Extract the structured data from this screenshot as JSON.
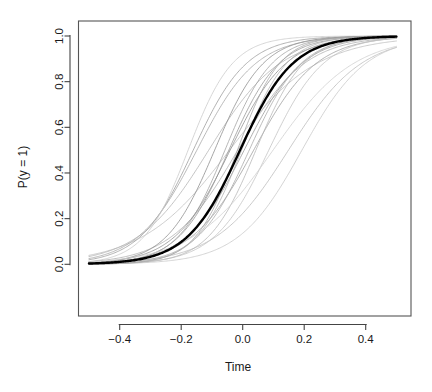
{
  "figure": {
    "type": "r-base-graphics-plot",
    "background_color": "#ffffff",
    "width": 432,
    "height": 392
  },
  "chart_data": {
    "type": "line",
    "title": "",
    "subtitle": "",
    "xlabel": "Time",
    "ylabel": "P(y = 1)",
    "xlim": [
      -0.5,
      0.5
    ],
    "ylim": [
      0.0,
      1.0
    ],
    "grid": false,
    "legend": null,
    "legend_position": "none",
    "x_ticks": [
      -0.4,
      -0.2,
      0.0,
      0.2,
      0.4
    ],
    "x_tick_labels": [
      "-0.4",
      "-0.2",
      "0.0",
      "0.2",
      "0.4"
    ],
    "y_ticks": [
      0.0,
      0.2,
      0.4,
      0.6,
      0.8,
      1.0
    ],
    "y_tick_labels": [
      "0.0",
      "0.2",
      "0.4",
      "0.6",
      "0.8",
      "1.0"
    ],
    "box_drawn": true,
    "box_color": "#555555",
    "series": [
      {
        "name": "draw-1",
        "role": "draw",
        "color": "#bfbfbf",
        "linewidth": 0.8,
        "model": "logistic",
        "intercept": 0.3,
        "slope": 7.0,
        "values_at_ticks": [
          0.02,
          0.08,
          0.57,
          0.95,
          0.99
        ]
      },
      {
        "name": "draw-2",
        "role": "draw",
        "color": "#b5b5b5",
        "linewidth": 0.8,
        "model": "logistic",
        "intercept": 0.95,
        "slope": 8.6,
        "values_at_ticks": [
          0.05,
          0.22,
          0.72,
          0.96,
          0.995
        ]
      },
      {
        "name": "draw-3",
        "role": "draw",
        "color": "#9e9e9e",
        "linewidth": 0.8,
        "model": "logistic",
        "intercept": 1.85,
        "slope": 11.5,
        "values_at_ticks": [
          0.03,
          0.24,
          0.86,
          0.99,
          1.0
        ]
      },
      {
        "name": "draw-4",
        "role": "draw",
        "color": "#a8a8a8",
        "linewidth": 0.8,
        "model": "logistic",
        "intercept": 1.55,
        "slope": 10.4,
        "values_at_ticks": [
          0.03,
          0.19,
          0.82,
          0.98,
          1.0
        ]
      },
      {
        "name": "draw-5",
        "role": "draw",
        "color": "#cccccc",
        "linewidth": 0.8,
        "model": "logistic",
        "intercept": 2.45,
        "slope": 13.8,
        "values_at_ticks": [
          0.03,
          0.32,
          0.92,
          0.995,
          1.0
        ]
      },
      {
        "name": "draw-6",
        "role": "draw",
        "color": "#b0b0b0",
        "linewidth": 0.8,
        "model": "logistic",
        "intercept": 0.15,
        "slope": 9.2,
        "values_at_ticks": [
          0.02,
          0.11,
          0.54,
          0.92,
          0.99
        ]
      },
      {
        "name": "draw-7",
        "role": "draw",
        "color": "#a0a0a0",
        "linewidth": 0.8,
        "model": "logistic",
        "intercept": -0.35,
        "slope": 9.8,
        "values_at_ticks": [
          0.01,
          0.08,
          0.41,
          0.88,
          0.98
        ]
      },
      {
        "name": "draw-8",
        "role": "draw",
        "color": "#9a9a9a",
        "linewidth": 0.8,
        "model": "logistic",
        "intercept": -0.05,
        "slope": 10.6,
        "values_at_ticks": [
          0.01,
          0.08,
          0.49,
          0.92,
          0.99
        ]
      },
      {
        "name": "draw-9",
        "role": "draw",
        "color": "#bdbdbd",
        "linewidth": 0.8,
        "model": "logistic",
        "intercept": -1.25,
        "slope": 8.4,
        "values_at_ticks": [
          0.01,
          0.05,
          0.22,
          0.61,
          0.92
        ]
      },
      {
        "name": "draw-10",
        "role": "draw",
        "color": "#c4c4c4",
        "linewidth": 0.8,
        "model": "logistic",
        "intercept": -0.95,
        "slope": 11.2,
        "values_at_ticks": [
          0.005,
          0.04,
          0.28,
          0.79,
          0.97
        ]
      },
      {
        "name": "draw-11",
        "role": "draw",
        "color": "#989898",
        "linewidth": 0.8,
        "model": "logistic",
        "intercept": 0.55,
        "slope": 12.2,
        "values_at_ticks": [
          0.01,
          0.13,
          0.63,
          0.96,
          0.999
        ]
      },
      {
        "name": "draw-12",
        "role": "draw",
        "color": "#a4a4a4",
        "linewidth": 0.8,
        "model": "logistic",
        "intercept": 0.75,
        "slope": 13.0,
        "values_at_ticks": [
          0.008,
          0.14,
          0.68,
          0.97,
          0.999
        ]
      },
      {
        "name": "draw-13",
        "role": "draw",
        "color": "#8f8f8f",
        "linewidth": 0.8,
        "model": "logistic",
        "intercept": 1.15,
        "slope": 12.6,
        "values_at_ticks": [
          0.01,
          0.19,
          0.76,
          0.98,
          0.999
        ]
      },
      {
        "name": "draw-14",
        "role": "draw",
        "color": "#b8b8b8",
        "linewidth": 0.8,
        "model": "logistic",
        "intercept": -0.55,
        "slope": 12.8,
        "values_at_ticks": [
          0.003,
          0.05,
          0.37,
          0.88,
          0.99
        ]
      },
      {
        "name": "draw-15",
        "role": "draw",
        "color": "#ababab",
        "linewidth": 0.8,
        "model": "logistic",
        "intercept": -0.25,
        "slope": 11.8,
        "values_at_ticks": [
          0.005,
          0.07,
          0.44,
          0.9,
          0.99
        ]
      },
      {
        "name": "draw-16",
        "role": "draw",
        "color": "#929292",
        "linewidth": 0.8,
        "model": "logistic",
        "intercept": 0.45,
        "slope": 11.0,
        "values_at_ticks": [
          0.01,
          0.12,
          0.61,
          0.94,
          0.99
        ]
      },
      {
        "name": "draw-17",
        "role": "draw",
        "color": "#c9c9c9",
        "linewidth": 0.8,
        "model": "logistic",
        "intercept": -1.85,
        "slope": 9.6,
        "values_at_ticks": [
          0.002,
          0.02,
          0.14,
          0.5,
          0.87
        ]
      },
      {
        "name": "draw-18",
        "role": "draw",
        "color": "#b2b2b2",
        "linewidth": 0.8,
        "model": "logistic",
        "intercept": 0.05,
        "slope": 13.6,
        "values_at_ticks": [
          0.003,
          0.06,
          0.51,
          0.94,
          0.998
        ]
      },
      {
        "name": "draw-19",
        "role": "draw",
        "color": "#a6a6a6",
        "linewidth": 0.8,
        "model": "logistic",
        "intercept": 0.25,
        "slope": 14.5,
        "values_at_ticks": [
          0.002,
          0.06,
          0.56,
          0.96,
          0.999
        ]
      },
      {
        "name": "draw-20",
        "role": "draw",
        "color": "#cfcfcf",
        "linewidth": 0.8,
        "model": "logistic",
        "intercept": -0.75,
        "slope": 7.6,
        "values_at_ticks": [
          0.02,
          0.08,
          0.32,
          0.7,
          0.93
        ]
      },
      {
        "name": "mean-curve",
        "role": "mean",
        "color": "#000000",
        "linewidth": 2.4,
        "model": "logistic",
        "intercept": 0.1,
        "slope": 11.6,
        "values_at_ticks": [
          0.006,
          0.08,
          0.52,
          0.92,
          0.99
        ]
      }
    ]
  },
  "axes": {
    "x_axis_label": "Time",
    "y_axis_label": "P(y = 1)"
  }
}
